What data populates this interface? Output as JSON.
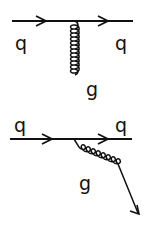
{
  "diagram": {
    "type": "feynman",
    "labels": {
      "top_in": "q",
      "top_out": "q",
      "propagator": "g",
      "bottom_in": "q",
      "bottom_out": "q",
      "emitted": "g"
    },
    "color": "#111111"
  }
}
